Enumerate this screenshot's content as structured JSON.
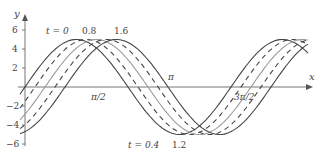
{
  "chart_data": {
    "type": "line",
    "title": "",
    "xlabel": "x",
    "ylabel": "y",
    "ylim": [
      -6,
      6
    ],
    "yticks": [
      -6,
      -4,
      -2,
      2,
      4,
      6
    ],
    "xticks": [
      {
        "label": "π/2",
        "value": 1.5708
      },
      {
        "label": "π",
        "value": 3.1416
      },
      {
        "label": "3π/2",
        "value": 4.7124
      }
    ],
    "grid": false,
    "legend": "inline annotations",
    "amplitude": 5,
    "series": [
      {
        "name": "t = 0",
        "style": "solid",
        "color": "#444444",
        "phase_shift": 0.0
      },
      {
        "name": "t = 0.4",
        "style": "dashed",
        "color": "#444444",
        "phase_shift": 0.4
      },
      {
        "name": "t = 0.8",
        "style": "solid",
        "color": "#9a9a9a",
        "phase_shift": 0.8
      },
      {
        "name": "t = 1.2",
        "style": "dashed",
        "color": "#444444",
        "phase_shift": 1.2
      },
      {
        "name": "t = 1.6",
        "style": "solid",
        "color": "#444444",
        "phase_shift": 1.6
      }
    ],
    "annotations": [
      {
        "text": "t = 0",
        "position": "top"
      },
      {
        "text": "0.8",
        "position": "top"
      },
      {
        "text": "1.6",
        "position": "top"
      },
      {
        "text": "t = 0.4",
        "position": "bottom"
      },
      {
        "text": "1.2",
        "position": "bottom"
      }
    ]
  },
  "labels": {
    "y_axis": "y",
    "x_axis": "x",
    "top_t0": "t = 0",
    "top_t08": "0.8",
    "top_t16": "1.6",
    "bottom_t04": "t = 0.4",
    "bottom_t12": "1.2",
    "tick_pi2": "π/2",
    "tick_pi": "π",
    "tick_3pi2": "3π/2",
    "ytick_6": "6",
    "ytick_4": "4",
    "ytick_2": "2",
    "ytick_m2": "−2",
    "ytick_m4": "−4",
    "ytick_m6": "−6"
  }
}
